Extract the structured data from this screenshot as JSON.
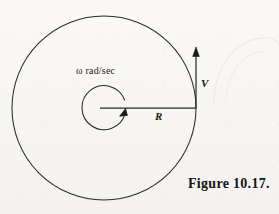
{
  "figure": {
    "caption": "Figure 10.17.",
    "background_color": "#f8f7f5",
    "ink_color": "#2a2a2a",
    "labels": {
      "angular_velocity": "ω rad/sec",
      "angular_velocity_symbol": "ω",
      "angular_velocity_units": "rad/sec",
      "radius": "R",
      "velocity": "V"
    },
    "geometry": {
      "center_x": 104,
      "center_y": 108,
      "outer_circle_radius": 92,
      "inner_arc_radius": 22,
      "radius_line_from_x": 100,
      "radius_line_to_x": 196,
      "radius_line_y": 108,
      "velocity_arrow_x": 196,
      "velocity_arrow_tail_y": 108,
      "velocity_arrow_tip_y": 48,
      "rotation_direction": "counterclockwise"
    }
  }
}
